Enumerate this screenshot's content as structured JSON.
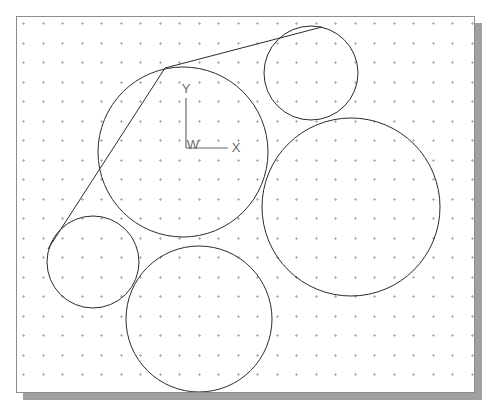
{
  "canvas": {
    "background_color": "#ffffff",
    "frame_border_color": "#8c8c8c",
    "shadow_color": "#a0a0a0",
    "grid": {
      "dot_color": "#b4b4b4",
      "spacing_px": 19.5,
      "style": "cross-dot"
    },
    "geometry_color": "#2b2b2b",
    "axis_color": "#6a6a6a"
  },
  "coordinate_system": {
    "name": "work-coordinate-system",
    "origin_label": "W",
    "y_axis_label": "Y",
    "x_axis_label": "X",
    "origin_px": {
      "x": 186,
      "y": 148
    },
    "y_tip_px": {
      "x": 186,
      "y": 98
    },
    "x_tip_px": {
      "x": 228,
      "y": 148
    }
  },
  "chart_data": {
    "type": "scatter",
    "title": "",
    "xlabel": "X",
    "ylabel": "Y",
    "circles": [
      {
        "name": "circle-center-large",
        "cx": 183,
        "cy": 152,
        "r": 85
      },
      {
        "name": "circle-top-right",
        "cx": 311,
        "cy": 73,
        "r": 47
      },
      {
        "name": "circle-right-large",
        "cx": 351,
        "cy": 207,
        "r": 89
      },
      {
        "name": "circle-left-small",
        "cx": 93,
        "cy": 262,
        "r": 46
      },
      {
        "name": "circle-bottom-medium",
        "cx": 199,
        "cy": 319,
        "r": 73
      }
    ],
    "lines": [
      {
        "name": "tangent-top",
        "x1": 322,
        "y1": 27,
        "x2": 165,
        "y2": 68
      },
      {
        "name": "tangent-left",
        "x1": 165,
        "y1": 68,
        "x2": 48,
        "y2": 249
      }
    ]
  }
}
